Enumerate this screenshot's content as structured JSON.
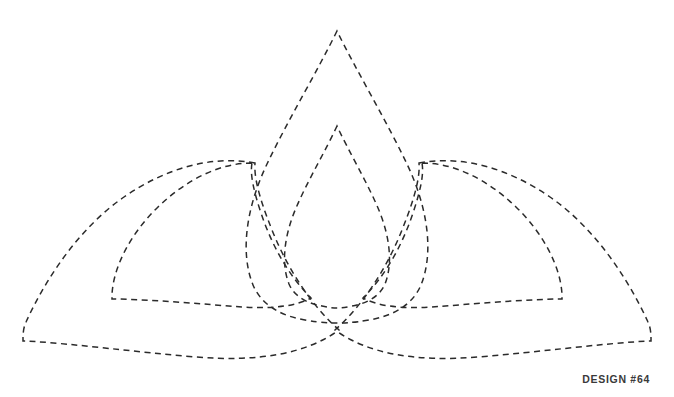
{
  "page": {
    "title": "DESIGN #64",
    "background_color": "#ffffff",
    "width": 674,
    "height": 397
  },
  "caption": {
    "text": "DESIGN #64"
  },
  "artwork": {
    "name": "interlaced-trefoil-petal-design",
    "stroke_color": "#2b2b2b",
    "stroke_width": 1.5,
    "dash_pattern": "6 4.5",
    "fill": "none",
    "description": "Four overlapping dashed teardrop petals forming a symmetric trefoil crown",
    "paths": [
      {
        "id": "center-large-arch",
        "label": "Large central pointed arch",
        "d": "M 337 31 C 318 70 288 120 267 164 C 246 208 240 253 253 285 C 262 306 282 316 305 320 C 322 323 332 323 337 323 C 342 323 352 323 369 320 C 392 316 412 306 421 285 C 434 253 428 208 407 164 C 386 120 356 70 337 31 Z"
      },
      {
        "id": "center-small-arch",
        "label": "Small central pointed arch",
        "d": "M 337 126 C 326 150 308 180 296 208 C 284 236 281 264 289 284 C 295 298 310 304 322 306 C 331 308 335 308 337 308 C 339 308 343 308 352 306 C 364 304 379 298 385 284 C 393 264 390 236 378 208 C 366 180 348 150 337 126 Z"
      },
      {
        "id": "left-outer-petal",
        "label": "Large left outer petal",
        "d": "M 255 163 C 212 155 166 168 124 197 C 82 226 48 274 26 322 C 24 326 23 332 23 338 L 23 341 L 26 341 C 78 344 134 352 196 357 C 258 362 306 354 339 330 C 312 306 288 270 272 230 C 258 195 254 176 255 163 Z"
      },
      {
        "id": "left-inner-petal",
        "label": "Left inner petal",
        "d": "M 252 163 C 219 163 186 180 158 207 C 130 234 113 268 112 295 L 112 299 L 116 299 C 158 300 202 304 242 307 C 274 309 296 306 311 298 C 289 276 272 246 261 213 C 253 189 250 173 252 163 Z"
      },
      {
        "id": "right-outer-petal",
        "label": "Large right outer petal",
        "d": "M 419 163 C 462 155 508 168 550 197 C 592 226 626 274 648 322 C 650 326 651 332 651 338 L 651 341 L 648 341 C 596 344 540 352 478 357 C 416 362 368 354 335 330 C 362 306 386 270 402 230 C 416 195 420 176 419 163 Z"
      },
      {
        "id": "right-inner-petal",
        "label": "Right inner petal",
        "d": "M 422 163 C 455 163 488 180 516 207 C 544 234 561 268 562 295 L 562 299 L 558 299 C 516 300 472 304 432 307 C 400 309 378 306 363 298 C 385 276 402 246 413 213 C 421 189 424 173 422 163 Z"
      }
    ]
  }
}
